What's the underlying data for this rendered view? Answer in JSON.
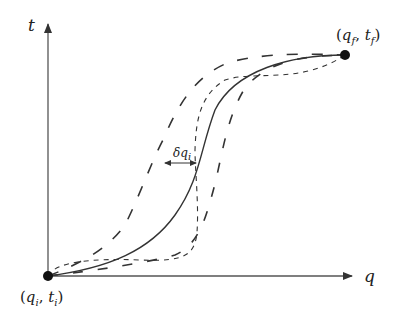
{
  "diagram": {
    "type": "trajectory-variation",
    "colors": {
      "stroke": "#333333",
      "axis": "#555555",
      "point": "#111111"
    },
    "axes": {
      "x": {
        "label": "q"
      },
      "y": {
        "label": "t"
      }
    },
    "points": {
      "start": {
        "label_base_q": "q",
        "label_sub_q": "i",
        "label_base_t": "t",
        "label_sub_t": "i",
        "text": "(q_i, t_i)"
      },
      "end": {
        "label_base_q": "q",
        "label_sub_q": "f",
        "label_base_t": "t",
        "label_sub_t": "f",
        "text": "(q_f, t_f)"
      }
    },
    "annotation": {
      "base": "δq",
      "sub": "i",
      "text": "δq_i"
    },
    "curves": [
      {
        "name": "true-path",
        "style": "solid"
      },
      {
        "name": "varied-path-left",
        "style": "long-dash"
      },
      {
        "name": "varied-path-right",
        "style": "long-dash"
      },
      {
        "name": "varied-path-short",
        "style": "short-dash"
      }
    ],
    "punct": {
      "open": "(",
      "comma": ", ",
      "close": ")"
    }
  }
}
